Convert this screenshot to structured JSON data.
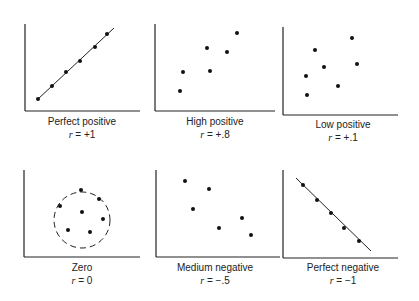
{
  "chart_data": [
    {
      "type": "scatter",
      "title": "Perfect positive",
      "r_label": "r = +1",
      "r_value": 1,
      "fit_line": true,
      "axes": {
        "origin": [
          25,
          111
        ],
        "x_end": 140,
        "y_top": 24
      },
      "points": [
        [
          38,
          99
        ],
        [
          52,
          86
        ],
        [
          66,
          72
        ],
        [
          80,
          61
        ],
        [
          95,
          47
        ],
        [
          107,
          34
        ]
      ],
      "line": [
        [
          38,
          99
        ],
        [
          114,
          28
        ]
      ]
    },
    {
      "type": "scatter",
      "title": "High positive",
      "r_label": "r = +.8",
      "r_value": 0.8,
      "fit_line": false,
      "axes": {
        "origin": [
          155,
          111
        ],
        "x_end": 275,
        "y_top": 24
      },
      "points": [
        [
          180,
          91
        ],
        [
          183,
          72
        ],
        [
          207,
          48
        ],
        [
          210,
          71
        ],
        [
          227,
          52
        ],
        [
          237,
          33
        ]
      ]
    },
    {
      "type": "scatter",
      "title": "Low positive",
      "r_label": "r = +.1",
      "r_value": 0.1,
      "fit_line": false,
      "axes": {
        "origin": [
          283,
          115
        ],
        "x_end": 398,
        "y_top": 27
      },
      "points": [
        [
          315,
          50
        ],
        [
          324,
          67
        ],
        [
          306,
          76
        ],
        [
          307,
          95
        ],
        [
          338,
          86
        ],
        [
          352,
          38
        ],
        [
          357,
          64
        ]
      ]
    },
    {
      "type": "scatter",
      "title": "Zero",
      "r_label": "r = 0",
      "r_value": 0,
      "fit_line": false,
      "dashed_circle": {
        "cx": 82,
        "cy": 220,
        "r": 28
      },
      "axes": {
        "origin": [
          24,
          257
        ],
        "x_end": 140,
        "y_top": 170
      },
      "points": [
        [
          81,
          190
        ],
        [
          60,
          206
        ],
        [
          99,
          199
        ],
        [
          82,
          212
        ],
        [
          103,
          219
        ],
        [
          68,
          230
        ],
        [
          90,
          232
        ]
      ]
    },
    {
      "type": "scatter",
      "title": "Medium negative",
      "r_label": "r = −.5",
      "r_value": -0.5,
      "fit_line": false,
      "axes": {
        "origin": [
          156,
          257
        ],
        "x_end": 280,
        "y_top": 170
      },
      "points": [
        [
          185,
          181
        ],
        [
          193,
          209
        ],
        [
          209,
          189
        ],
        [
          219,
          228
        ],
        [
          242,
          218
        ],
        [
          251,
          235
        ]
      ]
    },
    {
      "type": "scatter",
      "title": "Perfect negative",
      "r_label": "r = −1",
      "r_value": -1,
      "fit_line": true,
      "axes": {
        "origin": [
          283,
          258
        ],
        "x_end": 398,
        "y_top": 170
      },
      "points": [
        [
          303,
          185
        ],
        [
          317,
          200
        ],
        [
          331,
          213
        ],
        [
          344,
          228
        ],
        [
          359,
          241
        ]
      ],
      "line": [
        [
          296,
          178
        ],
        [
          371,
          251
        ]
      ]
    }
  ],
  "labels": [
    {
      "title": "Perfect positive",
      "r_prefix": "r",
      "r_rest": " = +1"
    },
    {
      "title": "High positive",
      "r_prefix": "r",
      "r_rest": " = +.8"
    },
    {
      "title": "Low positive",
      "r_prefix": "r",
      "r_rest": " = +.1"
    },
    {
      "title": "Zero",
      "r_prefix": "r",
      "r_rest": " = 0"
    },
    {
      "title": "Medium negative",
      "r_prefix": "r",
      "r_rest": " = −.5"
    },
    {
      "title": "Perfect negative",
      "r_prefix": "r",
      "r_rest": " = −1"
    }
  ]
}
